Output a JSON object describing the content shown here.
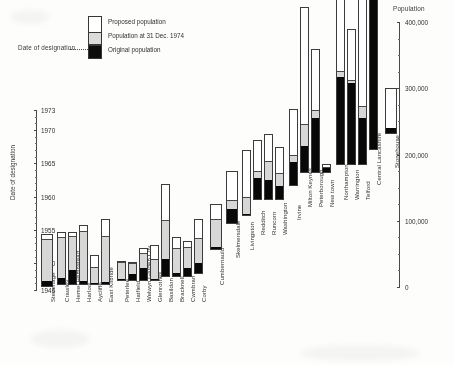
{
  "figure": {
    "legend": {
      "items": [
        {
          "key": "proposed",
          "label": "Proposed population",
          "color": "#ffffff"
        },
        {
          "key": "current",
          "label": "Population at 31 Dec. 1974",
          "color": "#d4d4d4"
        },
        {
          "key": "original",
          "label": "Original population",
          "color": "#0d0d0d"
        }
      ],
      "designation_note": "Date of designation"
    },
    "left_axis": {
      "title": "Date of designation",
      "ticks": [
        1946,
        1950,
        1955,
        1960,
        1965,
        1970,
        1973
      ],
      "tick_labels": [
        "1946",
        "1950",
        "1955",
        "1960",
        "1965",
        "1970",
        "1973"
      ],
      "range": [
        1946,
        1973
      ]
    },
    "right_axis": {
      "title": "Population",
      "ticks": [
        0,
        100000,
        200000,
        300000,
        400000
      ],
      "tick_labels": [
        "0",
        "100,000",
        "200,000",
        "300,000",
        "400,000"
      ],
      "range": [
        0,
        400000
      ],
      "minor_step": 25000
    }
  },
  "chart_data": {
    "type": "bar",
    "title": "",
    "subtitle": "",
    "xlabel": "Date of designation",
    "ylabel": "Population",
    "ylim": [
      0,
      400000
    ],
    "xlim_years": [
      1946,
      1973
    ],
    "grid": false,
    "legend_position": "top-left",
    "note": "Stacked bars: each New Town plotted at its date of designation (bar base) with original population, population at 31 Dec 1974 and proposed population.",
    "categories": [
      "Stevenage",
      "Crawley",
      "Hemel Hempstead",
      "Harlow",
      "Aycliffe",
      "East Kilbride",
      "Peterlee",
      "Hatfield",
      "Welwyn Garden City",
      "Glenrothes",
      "Basildon",
      "Bracknell",
      "Cwmbran",
      "Corby",
      "Cumbernauld",
      "Skelmersdale",
      "Livingston",
      "Redditch",
      "Runcorn",
      "Washington",
      "Irvine",
      "Milton Keynes",
      "Peterborough",
      "New town",
      "Northampton",
      "Warrington",
      "Telford",
      "Central Lancashire",
      "Stonehouse"
    ],
    "series": [
      {
        "name": "Original population",
        "values": [
          7000,
          9000,
          21000,
          4500,
          60,
          2400,
          200,
          8500,
          18500,
          1100,
          25000,
          5000,
          12000,
          15700,
          3000,
          21000,
          2000,
          32000,
          28500,
          20000,
          34500,
          40000,
          81000,
          5500,
          131000,
          122000,
          70000,
          235000,
          7000
        ]
      },
      {
        "name": "Population at 31 Dec. 1974",
        "values": [
          71000,
          71000,
          73000,
          80000,
          25000,
          73000,
          27000,
          26000,
          41000,
          31000,
          85000,
          43000,
          44000,
          53000,
          45000,
          35000,
          27000,
          42000,
          58000,
          40000,
          45000,
          72000,
          93000,
          7500,
          140000,
          127000,
          88000,
          245000,
          7000
        ]
      },
      {
        "name": "Proposed population",
        "values": [
          80000,
          80000,
          80000,
          90000,
          45000,
          100000,
          30000,
          29000,
          50000,
          55000,
          140000,
          60000,
          55000,
          83000,
          70000,
          80000,
          100000,
          90000,
          100000,
          80000,
          116000,
          250000,
          187000,
          13000,
          260000,
          205000,
          250000,
          285000,
          70000
        ]
      }
    ],
    "designation_years": [
      1946,
      1947,
      1947,
      1947,
      1947,
      1947,
      1948,
      1948,
      1948,
      1948,
      1949,
      1949,
      1949,
      1950,
      1955,
      1961,
      1962,
      1964,
      1964,
      1964,
      1966,
      1967,
      1967,
      1967,
      1968,
      1968,
      1968,
      1970,
      1973
    ],
    "bars": [
      {
        "label": "Stevenage",
        "year": 1946,
        "original": 7000,
        "current": 71000,
        "proposed": 80000
      },
      {
        "label": "Crawley",
        "year": 1947,
        "original": 9000,
        "current": 71000,
        "proposed": 80000
      },
      {
        "label": "Hemel Hempstead",
        "year": 1947,
        "original": 21000,
        "current": 73000,
        "proposed": 80000
      },
      {
        "label": "Harlow",
        "year": 1947,
        "original": 4500,
        "current": 80000,
        "proposed": 90000
      },
      {
        "label": "Aycliffe",
        "year": 1947,
        "original": 60,
        "current": 25000,
        "proposed": 45000
      },
      {
        "label": "East Kilbride",
        "year": 1947,
        "original": 2400,
        "current": 73000,
        "proposed": 100000
      },
      {
        "label": "Peterlee",
        "year": 1948,
        "original": 200,
        "current": 27000,
        "proposed": 30000
      },
      {
        "label": "Hatfield",
        "year": 1948,
        "original": 8500,
        "current": 26000,
        "proposed": 29000
      },
      {
        "label": "Welwyn Garden City",
        "year": 1948,
        "original": 18500,
        "current": 41000,
        "proposed": 50000
      },
      {
        "label": "Glenrothes",
        "year": 1948,
        "original": 1100,
        "current": 31000,
        "proposed": 55000
      },
      {
        "label": "Basildon",
        "year": 1949,
        "original": 25000,
        "current": 85000,
        "proposed": 140000
      },
      {
        "label": "Bracknell",
        "year": 1949,
        "original": 5000,
        "current": 43000,
        "proposed": 60000
      },
      {
        "label": "Cwmbran",
        "year": 1949,
        "original": 12000,
        "current": 44000,
        "proposed": 55000
      },
      {
        "label": "Corby",
        "year": 1950,
        "original": 15700,
        "current": 53000,
        "proposed": 83000
      },
      {
        "label": "Cumbernauld",
        "year": 1955,
        "original": 3000,
        "current": 45000,
        "proposed": 70000
      },
      {
        "label": "Skelmersdale",
        "year": 1961,
        "original": 21000,
        "current": 35000,
        "proposed": 80000
      },
      {
        "label": "Livingston",
        "year": 1962,
        "original": 2000,
        "current": 27000,
        "proposed": 100000
      },
      {
        "label": "Redditch",
        "year": 1964,
        "original": 32000,
        "current": 42000,
        "proposed": 90000
      },
      {
        "label": "Runcorn",
        "year": 1964,
        "original": 28500,
        "current": 58000,
        "proposed": 100000
      },
      {
        "label": "Washington",
        "year": 1964,
        "original": 20000,
        "current": 40000,
        "proposed": 80000
      },
      {
        "label": "Irvine",
        "year": 1966,
        "original": 34500,
        "current": 45000,
        "proposed": 116000
      },
      {
        "label": "Milton Keynes",
        "year": 1967,
        "original": 40000,
        "current": 72000,
        "proposed": 250000
      },
      {
        "label": "Peterborough",
        "year": 1967,
        "original": 81000,
        "current": 93000,
        "proposed": 187000
      },
      {
        "label": "New town",
        "year": 1967,
        "original": 5500,
        "current": 7500,
        "proposed": 13000
      },
      {
        "label": "Northampton",
        "year": 1968,
        "original": 131000,
        "current": 140000,
        "proposed": 260000
      },
      {
        "label": "Warrington",
        "year": 1968,
        "original": 122000,
        "current": 127000,
        "proposed": 205000
      },
      {
        "label": "Telford",
        "year": 1968,
        "original": 70000,
        "current": 88000,
        "proposed": 250000
      },
      {
        "label": "Central Lancashire",
        "year": 1970,
        "original": 235000,
        "current": 245000,
        "proposed": 285000
      },
      {
        "label": "Stonehouse",
        "year": 1973,
        "original": 7000,
        "current": 7000,
        "proposed": 70000
      }
    ]
  },
  "layout": {
    "bar_x": [
      41,
      57,
      68,
      79,
      90,
      101,
      117,
      128,
      139,
      150,
      161,
      172,
      183,
      194,
      210,
      226,
      242,
      253,
      264,
      275,
      289,
      300,
      311,
      322,
      336,
      347,
      358,
      369,
      385
    ],
    "bar_w": [
      12,
      9,
      9,
      9,
      9,
      9,
      9,
      9,
      9,
      9,
      9,
      9,
      9,
      9,
      12,
      12,
      9,
      9,
      9,
      9,
      9,
      9,
      9,
      9,
      9,
      9,
      9,
      9,
      12
    ],
    "base_y": [
      287,
      285,
      285,
      285,
      285,
      285,
      281,
      281,
      281,
      281,
      277,
      277,
      277,
      274,
      250,
      224,
      216,
      200,
      200,
      200,
      186,
      173,
      173,
      173,
      165,
      165,
      165,
      150,
      134
    ],
    "label_y": [
      302,
      302,
      302,
      302,
      302,
      302,
      302,
      302,
      302,
      302,
      302,
      302,
      302,
      302,
      285,
      258,
      250,
      235,
      235,
      235,
      220,
      207,
      207,
      207,
      200,
      200,
      200,
      185,
      168
    ]
  }
}
